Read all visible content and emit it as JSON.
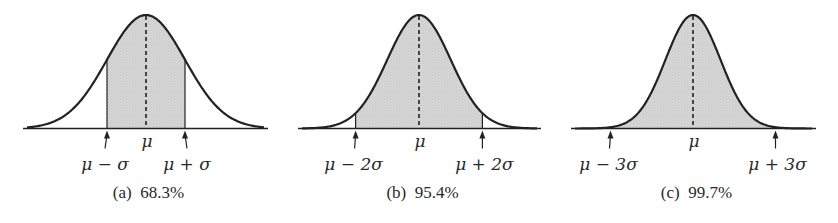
{
  "chart_data": [
    {
      "type": "area",
      "title": "(a) 68.3%",
      "caption_letter": "(a)",
      "caption_percent": "68.3%",
      "distribution": "normal",
      "shaded_interval_sigma": [
        -1,
        1
      ],
      "shaded_probability_percent": 68.3,
      "tick_labels": [
        "μ − σ",
        "μ",
        "μ + σ"
      ],
      "mean_line": "dashed",
      "grid": false
    },
    {
      "type": "area",
      "title": "(b) 95.4%",
      "caption_letter": "(b)",
      "caption_percent": "95.4%",
      "distribution": "normal",
      "shaded_interval_sigma": [
        -2,
        2
      ],
      "shaded_probability_percent": 95.4,
      "tick_labels": [
        "μ − 2σ",
        "μ",
        "μ + 2σ"
      ],
      "mean_line": "dashed",
      "grid": false
    },
    {
      "type": "area",
      "title": "(c) 99.7%",
      "caption_letter": "(c)",
      "caption_percent": "99.7%",
      "distribution": "normal",
      "shaded_interval_sigma": [
        -3,
        3
      ],
      "shaded_probability_percent": 99.7,
      "tick_labels": [
        "μ − 3σ",
        "μ",
        "μ + 3σ"
      ],
      "mean_line": "dashed",
      "grid": false
    }
  ],
  "panels": [
    {
      "id": "a",
      "axis": {
        "x0": 23,
        "x1": 268,
        "y": 128.5
      },
      "center": 146,
      "sigma": 39,
      "k": 1,
      "peak_y": 15,
      "labels": {
        "mu": "μ",
        "left": "μ − σ",
        "right": "μ + σ"
      },
      "caption": "(a)  68.3%"
    },
    {
      "id": "b",
      "axis": {
        "x0": 298,
        "x1": 541,
        "y": 128.5
      },
      "center": 419,
      "sigma": 31.7,
      "k": 2,
      "peak_y": 15,
      "labels": {
        "mu": "μ",
        "left": "μ − 2σ",
        "right": "μ + 2σ"
      },
      "caption": "(b)  95.4%"
    },
    {
      "id": "c",
      "axis": {
        "x0": 571,
        "x1": 816,
        "y": 128.5
      },
      "center": 693,
      "sigma": 27.5,
      "k": 3,
      "peak_y": 15,
      "labels": {
        "mu": "μ",
        "left": "μ − 3σ",
        "right": "μ + 3σ"
      },
      "caption": "(c)  99.7%"
    }
  ],
  "colors": {
    "ink": "#222222",
    "fill": "#d4d4d4",
    "background": "#ffffff"
  }
}
